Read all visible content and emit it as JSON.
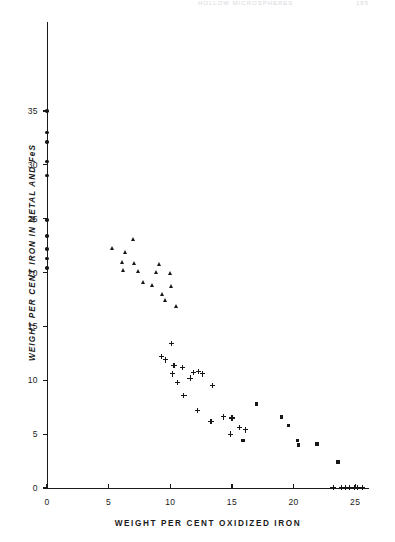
{
  "running_head": {
    "title": "HOLLOW MICROSPHERES",
    "page": "185"
  },
  "chart_data": {
    "type": "scatter",
    "title": "",
    "xlabel": "WEIGHT PER CENT OXIDIZED IRON",
    "ylabel": "WEIGHT PER CENT IRON IN METAL AND FeS",
    "xlim": [
      0,
      26
    ],
    "ylim": [
      0,
      36.5
    ],
    "xticks": [
      0,
      5,
      10,
      15,
      20,
      25
    ],
    "xtick_labels": [
      "0",
      "5",
      "10",
      "15",
      "20",
      "25"
    ],
    "yticks": [
      0,
      5,
      10,
      15,
      20,
      25,
      30,
      35
    ],
    "ytick_labels": [
      "0",
      "5",
      "10",
      "15",
      "20",
      "25",
      "30",
      "35"
    ],
    "grid": false,
    "legend": "none",
    "series": [
      {
        "name": "metal-rich (circles, x = 0 axis column)",
        "marker": "circle",
        "points": [
          [
            0.0,
            35.0
          ],
          [
            0.0,
            33.0
          ],
          [
            0.0,
            32.1
          ],
          [
            0.0,
            30.3
          ],
          [
            0.0,
            29.0
          ],
          [
            0.0,
            24.9
          ],
          [
            0.0,
            23.4
          ],
          [
            0.0,
            22.2
          ],
          [
            0.0,
            21.3
          ],
          [
            0.0,
            20.4
          ]
        ]
      },
      {
        "name": "intermediate (triangles)",
        "marker": "triangle",
        "points": [
          [
            7.0,
            23.1
          ],
          [
            5.3,
            22.3
          ],
          [
            6.4,
            21.9
          ],
          [
            6.1,
            21.0
          ],
          [
            7.1,
            20.9
          ],
          [
            9.1,
            20.8
          ],
          [
            6.2,
            20.2
          ],
          [
            7.4,
            20.1
          ],
          [
            8.9,
            20.0
          ],
          [
            10.0,
            19.9
          ],
          [
            7.8,
            19.1
          ],
          [
            8.6,
            18.8
          ],
          [
            10.1,
            18.7
          ],
          [
            9.4,
            18.0
          ],
          [
            9.6,
            17.4
          ],
          [
            10.5,
            16.9
          ]
        ]
      },
      {
        "name": "sulfide-rich (plus)",
        "marker": "plus",
        "points": [
          [
            10.1,
            13.4
          ],
          [
            9.3,
            12.2
          ],
          [
            9.6,
            11.9
          ],
          [
            10.3,
            11.4
          ],
          [
            11.0,
            11.2
          ],
          [
            10.2,
            10.6
          ],
          [
            11.9,
            10.7
          ],
          [
            12.3,
            10.8
          ],
          [
            12.6,
            10.6
          ],
          [
            11.6,
            10.2
          ],
          [
            10.6,
            9.8
          ],
          [
            13.4,
            9.5
          ],
          [
            11.1,
            8.6
          ],
          [
            12.2,
            7.2
          ],
          [
            14.3,
            6.6
          ],
          [
            15.0,
            6.5
          ],
          [
            13.3,
            6.2
          ],
          [
            15.6,
            5.6
          ],
          [
            16.1,
            5.4
          ],
          [
            14.9,
            5.0
          ],
          [
            23.2,
            0.05
          ],
          [
            23.9,
            0.05
          ],
          [
            24.2,
            0.05
          ],
          [
            24.5,
            0.05
          ],
          [
            24.9,
            0.05
          ],
          [
            25.2,
            0.05
          ],
          [
            25.6,
            0.05
          ]
        ]
      },
      {
        "name": "oxide-rich (squares)",
        "marker": "square",
        "points": [
          [
            17.0,
            7.8
          ],
          [
            19.0,
            6.6
          ],
          [
            19.6,
            5.8
          ],
          [
            15.9,
            4.4
          ],
          [
            20.3,
            4.4
          ],
          [
            20.4,
            4.0
          ],
          [
            21.9,
            4.1
          ],
          [
            23.6,
            2.4
          ]
        ]
      }
    ]
  }
}
